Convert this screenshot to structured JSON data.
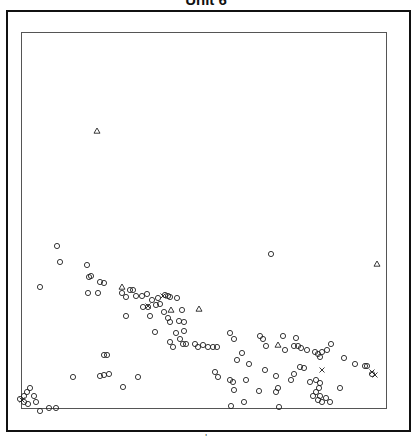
{
  "chart_data": {
    "type": "scatter",
    "title": "Unit 6",
    "xlabel": "",
    "ylabel": "",
    "grid": false,
    "legend": null,
    "plot_box_px": {
      "left": 21,
      "top": 32,
      "right": 387,
      "bottom": 409
    },
    "series": [
      {
        "name": "circles",
        "marker": "circle",
        "points_px": [
          [
            57,
            246
          ],
          [
            60,
            262
          ],
          [
            40,
            287
          ],
          [
            87,
            265
          ],
          [
            91,
            276
          ],
          [
            89,
            277
          ],
          [
            100,
            282
          ],
          [
            104,
            283
          ],
          [
            88,
            293
          ],
          [
            98,
            293
          ],
          [
            122,
            293
          ],
          [
            130,
            290
          ],
          [
            133,
            290
          ],
          [
            126,
            297
          ],
          [
            136,
            296
          ],
          [
            142,
            296
          ],
          [
            147,
            294
          ],
          [
            152,
            300
          ],
          [
            158,
            298
          ],
          [
            165,
            295
          ],
          [
            168,
            296
          ],
          [
            143,
            307
          ],
          [
            148,
            307
          ],
          [
            156,
            305
          ],
          [
            160,
            304
          ],
          [
            164,
            312
          ],
          [
            168,
            318
          ],
          [
            170,
            322
          ],
          [
            126,
            316
          ],
          [
            150,
            316
          ],
          [
            170,
            297
          ],
          [
            177,
            298
          ],
          [
            182,
            310
          ],
          [
            179,
            321
          ],
          [
            184,
            322
          ],
          [
            184,
            331
          ],
          [
            176,
            333
          ],
          [
            180,
            339
          ],
          [
            155,
            332
          ],
          [
            170,
            342
          ],
          [
            173,
            347
          ],
          [
            183,
            344
          ],
          [
            186,
            344
          ],
          [
            195,
            344
          ],
          [
            198,
            347
          ],
          [
            203,
            345
          ],
          [
            208,
            347
          ],
          [
            213,
            347
          ],
          [
            217,
            347
          ],
          [
            230,
            333
          ],
          [
            234,
            339
          ],
          [
            260,
            336
          ],
          [
            263,
            339
          ],
          [
            283,
            336
          ],
          [
            296,
            338
          ],
          [
            266,
            346
          ],
          [
            294,
            346
          ],
          [
            298,
            346
          ],
          [
            301,
            348
          ],
          [
            307,
            350
          ],
          [
            315,
            352
          ],
          [
            318,
            354
          ],
          [
            322,
            352
          ],
          [
            327,
            350
          ],
          [
            331,
            344
          ],
          [
            271,
            254
          ],
          [
            242,
            353
          ],
          [
            237,
            360
          ],
          [
            249,
            364
          ],
          [
            285,
            350
          ],
          [
            104,
            355
          ],
          [
            107,
            355
          ],
          [
            100,
            376
          ],
          [
            104,
            375
          ],
          [
            109,
            374
          ],
          [
            73,
            377
          ],
          [
            123,
            387
          ],
          [
            138,
            377
          ],
          [
            215,
            372
          ],
          [
            218,
            377
          ],
          [
            230,
            380
          ],
          [
            233,
            382
          ],
          [
            246,
            380
          ],
          [
            265,
            370
          ],
          [
            276,
            376
          ],
          [
            294,
            374
          ],
          [
            291,
            380
          ],
          [
            278,
            388
          ],
          [
            300,
            367
          ],
          [
            304,
            368
          ],
          [
            316,
            380
          ],
          [
            320,
            383
          ],
          [
            319,
            388
          ],
          [
            316,
            392
          ],
          [
            313,
            396
          ],
          [
            318,
            400
          ],
          [
            322,
            402
          ],
          [
            326,
            398
          ],
          [
            320,
            396
          ],
          [
            310,
            382
          ],
          [
            340,
            388
          ],
          [
            330,
            402
          ],
          [
            234,
            390
          ],
          [
            259,
            391
          ],
          [
            276,
            392
          ],
          [
            244,
            402
          ],
          [
            231,
            406
          ],
          [
            279,
            407
          ],
          [
            49,
            408
          ],
          [
            56,
            408
          ],
          [
            40,
            411
          ],
          [
            20,
            399
          ],
          [
            24,
            396
          ],
          [
            27,
            392
          ],
          [
            30,
            388
          ],
          [
            34,
            396
          ],
          [
            36,
            402
          ],
          [
            28,
            404
          ],
          [
            24,
            402
          ],
          [
            367,
            366
          ],
          [
            365,
            366
          ],
          [
            355,
            364
          ],
          [
            344,
            358
          ],
          [
            320,
            357
          ],
          [
            372,
            374
          ]
        ]
      },
      {
        "name": "triangles",
        "marker": "triangle",
        "points_px": [
          [
            97,
            131
          ],
          [
            377,
            264
          ],
          [
            122,
            287
          ],
          [
            171,
            310
          ],
          [
            199,
            309
          ],
          [
            278,
            345
          ]
        ]
      },
      {
        "name": "crosses",
        "marker": "x",
        "points_px": [
          [
            148,
            306
          ],
          [
            22,
            400
          ],
          [
            372,
            372
          ],
          [
            375,
            375
          ],
          [
            322,
            370
          ],
          [
            163,
            296
          ]
        ]
      }
    ]
  },
  "footer": {
    "tick_label": "'"
  }
}
